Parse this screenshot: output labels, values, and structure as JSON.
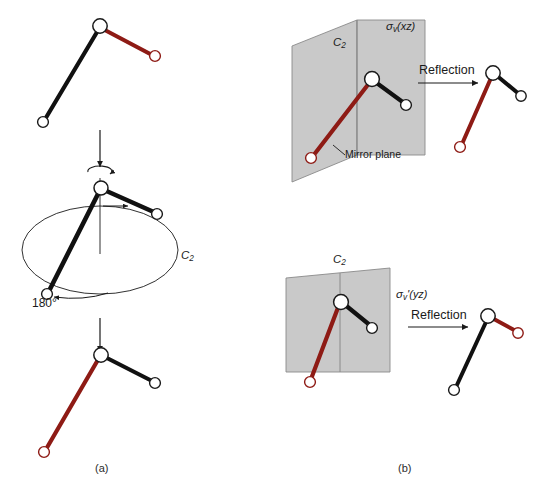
{
  "figure": {
    "panels": [
      {
        "id": "a",
        "label": "(a)",
        "operation": "C2 rotation"
      },
      {
        "id": "b",
        "label": "(b)",
        "operation": "reflection"
      }
    ]
  },
  "panel_a": {
    "caption": "(a)",
    "axis_label": "C",
    "axis_label_sub": "2",
    "rotation_angle": "180°",
    "molecules": {
      "top": {
        "name": "starting-molecule",
        "center_atom": "O",
        "bond_black_color": "#111111",
        "bond_red_color": "#8e1b15"
      },
      "middle": {
        "name": "rotating-molecule",
        "center_atom": "O"
      },
      "bottom": {
        "name": "rotated-molecule",
        "center_atom": "O"
      }
    }
  },
  "panel_b": {
    "caption": "(b)",
    "top": {
      "plane_label_sigma": "σ",
      "plane_label_sub": "v",
      "plane_label_axes": "(xz)",
      "axis_label": "C",
      "axis_label_sub": "2",
      "mirror_plane_label": "Mirror plane",
      "operation_label": "Reflection"
    },
    "bottom": {
      "plane_label_sigma": "σ",
      "plane_label_sub": "v",
      "plane_label_prime": "'",
      "plane_label_axes": "(yz)",
      "axis_label": "C",
      "axis_label_sub": "2",
      "operation_label": "Reflection"
    }
  },
  "colors": {
    "bond_black": "#111111",
    "bond_red": "#8e1b15",
    "atom_fill": "#ffffff",
    "atom_stroke_black": "#1a1a1a",
    "atom_stroke_red": "#8e1b15",
    "plane_fill": "#c9c9c9",
    "plane_stroke": "#8a8a8a",
    "arrow": "#1a1a1a",
    "background": "#ffffff"
  }
}
